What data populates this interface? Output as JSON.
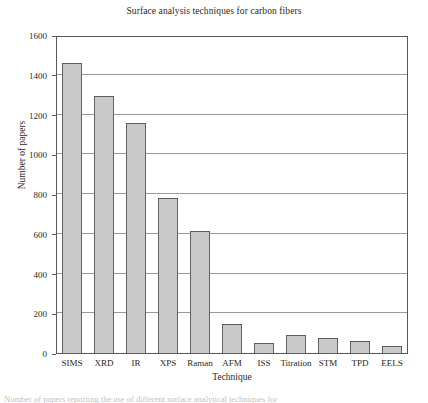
{
  "chart_data": {
    "type": "bar",
    "title": "Surface analysis techniques for carbon fibers",
    "xlabel": "Technique",
    "ylabel": "Number of papers",
    "categories": [
      "SIMS",
      "XRD",
      "IR",
      "XPS",
      "Raman",
      "AFM",
      "ISS",
      "Titration",
      "STM",
      "TPD",
      "EELS"
    ],
    "values": [
      1465,
      1300,
      1160,
      785,
      620,
      150,
      55,
      95,
      80,
      65,
      40
    ],
    "ylim": [
      0,
      1600
    ],
    "yticks": [
      0,
      200,
      400,
      600,
      800,
      1000,
      1200,
      1400,
      1600
    ],
    "ytick_labels": [
      "0",
      "200",
      "400",
      "600",
      "800",
      "1000",
      "1200",
      "1400",
      "1600"
    ],
    "grid": "horizontal",
    "legend": "none",
    "bar_fill_color": "#c9c9c9",
    "bar_edge_color": "#5e5e5e",
    "grid_color": "#9a9a9a",
    "frame_color": "#58595b",
    "text_color": "#2b2725"
  },
  "caption": {
    "clipped_line": "Number of papers reporting the use of different surface analytical techniques for"
  }
}
